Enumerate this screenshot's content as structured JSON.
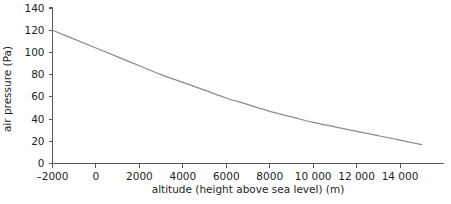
{
  "chart_data": {
    "type": "line",
    "title": "",
    "xlabel": "altitude (height above sea level) (m)",
    "ylabel": "air pressure (Pa)",
    "xlim": [
      -2000,
      16000
    ],
    "ylim": [
      0,
      140
    ],
    "grid": false,
    "legend": false,
    "x_ticks": [
      -2000,
      0,
      2000,
      4000,
      6000,
      8000,
      10000,
      12000,
      14000
    ],
    "x_tick_labels": [
      "–2000",
      "0",
      "2000",
      "4000",
      "6000",
      "8000",
      "10 000",
      "12 000",
      "14 000"
    ],
    "y_ticks": [
      0,
      20,
      40,
      60,
      80,
      100,
      120,
      140
    ],
    "y_tick_labels": [
      "0",
      "20",
      "40",
      "60",
      "80",
      "100",
      "120",
      "140"
    ],
    "series": [
      {
        "name": "air pressure",
        "color": "#8a8c8e",
        "x": [
          -2000,
          -1000,
          0,
          1000,
          2000,
          3000,
          4000,
          5000,
          6000,
          7000,
          8000,
          9000,
          10000,
          11000,
          12000,
          13000,
          14000,
          15000
        ],
        "values": [
          120,
          112,
          104,
          96,
          88,
          80,
          73,
          66,
          59,
          53,
          47,
          42,
          37,
          33,
          29,
          25,
          21,
          17
        ]
      }
    ]
  },
  "axis_titles": {
    "x": "altitude (height above sea level) (m)",
    "y": "air pressure (Pa)"
  }
}
